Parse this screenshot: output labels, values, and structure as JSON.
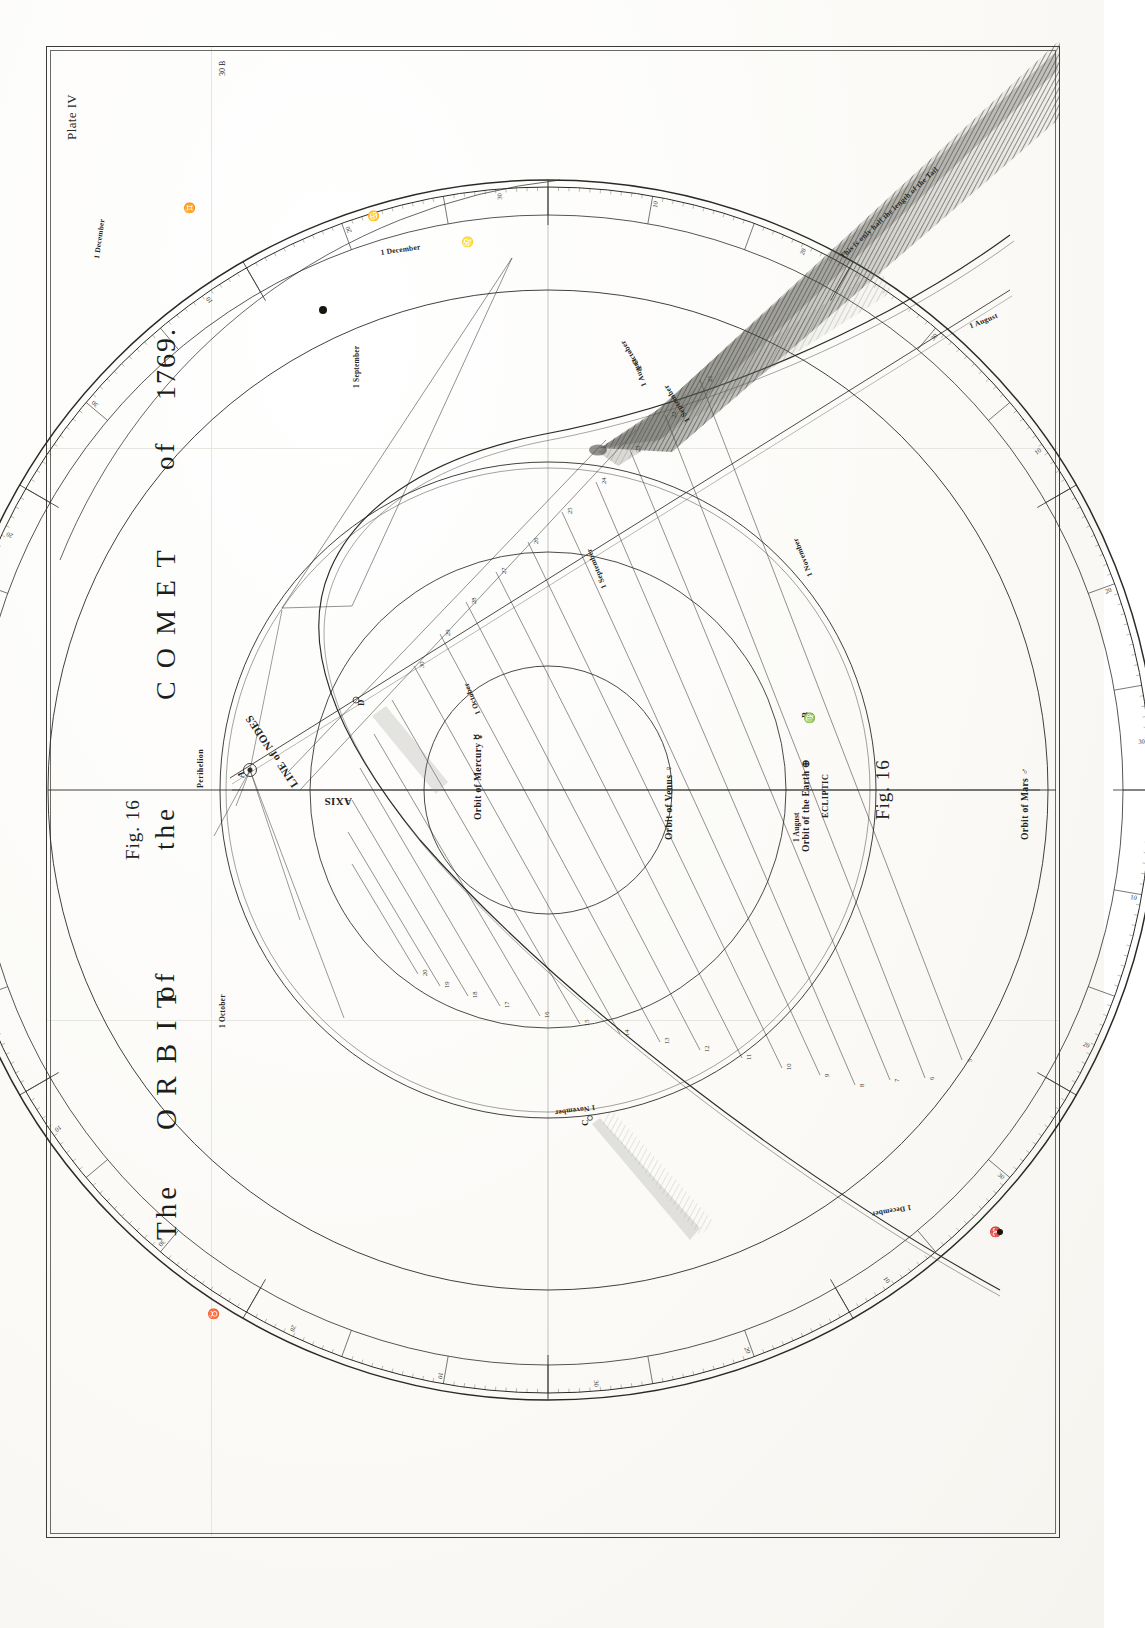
{
  "plate": {
    "number_label": "Plate IV",
    "corner_mark": "30 B",
    "background_color": "#fdfdfb",
    "ink_color": "#24241f"
  },
  "title": {
    "words": [
      "The",
      "O R B I T",
      "of",
      "the",
      "C O M E T",
      "of",
      "1769."
    ],
    "full": "The ORBIT of the COMET of 1769."
  },
  "figure": {
    "left_label": "Fig. 16",
    "right_label": "Fig. 16"
  },
  "orbit_labels": [
    {
      "name": "orbit-of-mercury",
      "text": "Orbit of Mercury ☿"
    },
    {
      "name": "orbit-of-venus",
      "text": "Orbit of Venus ♀"
    },
    {
      "name": "orbit-of-the-earth",
      "text": "Orbit of the Earth ⊕"
    },
    {
      "name": "orbit-of-mars",
      "text": "Orbit of Mars ♂"
    },
    {
      "name": "ecliptic",
      "text": "ECLIPTIC"
    }
  ],
  "geometry_labels": [
    {
      "name": "line-of-nodes",
      "text": "LINE of NODES"
    },
    {
      "name": "axis",
      "text": "AXIS"
    },
    {
      "name": "perihelion",
      "text": "Perihelion"
    }
  ],
  "date_labels": [
    {
      "name": "date-1-august-top",
      "text": "1 August"
    },
    {
      "name": "date-1-september-upper",
      "text": "1 September"
    },
    {
      "name": "date-1-october-upper",
      "text": "1 October"
    },
    {
      "name": "date-1-september-mid",
      "text": "1 September"
    },
    {
      "name": "date-1-october-mid",
      "text": "1 October"
    },
    {
      "name": "date-1-august-mid",
      "text": "1 August"
    },
    {
      "name": "date-1-november-lower",
      "text": "1 November"
    },
    {
      "name": "date-1-december-lower",
      "text": "1 December"
    },
    {
      "name": "date-1-december-upper",
      "text": "1 December"
    },
    {
      "name": "date-1-september-left",
      "text": "1 September"
    },
    {
      "name": "date-1-october-left",
      "text": "1 October"
    },
    {
      "name": "date-1-august-right",
      "text": "1 August"
    },
    {
      "name": "date-1-december-right",
      "text": "1 December"
    },
    {
      "name": "date-1-november-right",
      "text": "1 November"
    }
  ],
  "point_labels": [
    "A",
    "B",
    "C",
    "D"
  ],
  "tail_note": {
    "name": "tail-length-note",
    "text": "This is only half the length of the Tail"
  },
  "zodiac_marks": [
    {
      "symbol": "♊",
      "name": "gemini"
    },
    {
      "symbol": "♋",
      "name": "cancer"
    },
    {
      "symbol": "♌",
      "name": "leo"
    },
    {
      "symbol": "♍",
      "name": "virgo"
    },
    {
      "symbol": "♉",
      "name": "taurus"
    },
    {
      "symbol": "♈",
      "name": "aries"
    }
  ],
  "degree_ticks": [
    "10",
    "20",
    "30",
    "10",
    "20",
    "30",
    "10",
    "20",
    "30",
    "10",
    "20",
    "30",
    "10",
    "20",
    "30",
    "10",
    "20",
    "30",
    "10",
    "20",
    "30",
    "10",
    "20",
    "30"
  ],
  "radial_numbers": [
    "5",
    "6",
    "7",
    "8",
    "9",
    "10",
    "11",
    "12",
    "13",
    "14",
    "15",
    "16",
    "17",
    "18",
    "19",
    "20",
    "21",
    "22",
    "23",
    "24",
    "25",
    "26",
    "27",
    "28",
    "29",
    "30"
  ],
  "chart_data": {
    "type": "diagram",
    "subtitle": "Fig. 16",
    "bodies": [
      "Mercury",
      "Venus",
      "Earth",
      "Mars",
      "Comet of 1769"
    ],
    "dates_marked": [
      "1 August",
      "1 September",
      "1 October",
      "1 November",
      "1 December"
    ],
    "annotations": [
      "LINE of NODES",
      "AXIS",
      "Perihelion",
      "ECLIPTIC",
      "This is only half the length of the Tail"
    ]
  }
}
